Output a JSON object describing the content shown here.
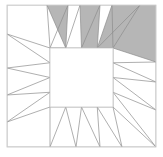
{
  "figure": {
    "type": "geometric-diagram",
    "canvas": {
      "width": 163,
      "height": 157
    },
    "colors": {
      "background": "#ffffff",
      "shaded_fill": "#b6b6b6",
      "unshaded_fill": "#ffffff",
      "stroke": "#8c8c8c",
      "frame_stroke": "#cccccc",
      "inner_square_stroke": "#cfcfcf"
    },
    "stroke_width": 0.7,
    "frame": {
      "x": 7,
      "y": 5,
      "width": 149,
      "height": 142
    },
    "inner_square": {
      "x": 50,
      "y": 48,
      "width": 63,
      "height": 59
    },
    "counts": {
      "total_points": 16,
      "shaded_points": 4,
      "unshaded_points": 12,
      "edges_per_side": 4
    },
    "rays": [
      {
        "id": "top-1",
        "side": "top",
        "shaded": false,
        "apex": [
          47,
          5
        ],
        "base": [
          50,
          48
        ],
        "base2": [
          65.75,
          48
        ]
      },
      {
        "id": "top-2",
        "side": "top",
        "shaded": true,
        "apex": [
          68,
          5
        ],
        "base": [
          65.75,
          48
        ],
        "base2": [
          50,
          48
        ]
      },
      {
        "id": "top-3",
        "side": "top",
        "shaded": false,
        "apex": [
          80,
          5
        ],
        "base": [
          81.5,
          48
        ],
        "base2": [
          65.75,
          48
        ]
      },
      {
        "id": "top-4",
        "side": "top",
        "shaded": true,
        "apex": [
          100,
          5
        ],
        "base": [
          81.5,
          48
        ],
        "base2": [
          97.25,
          48
        ]
      },
      {
        "id": "top-5",
        "side": "top",
        "shaded": false,
        "apex": [
          112,
          5
        ],
        "base": [
          97.25,
          48
        ],
        "base2": [
          113,
          48
        ]
      },
      {
        "id": "top-6",
        "side": "top",
        "shaded": true,
        "apex": [
          140,
          5
        ],
        "base": [
          113,
          48
        ],
        "base2": [
          97.25,
          48
        ]
      },
      {
        "id": "right-1",
        "side": "right",
        "shaded": true,
        "apex": [
          156,
          62
        ],
        "base": [
          113,
          48
        ],
        "base2": [
          113,
          62.75
        ]
      },
      {
        "id": "right-2",
        "side": "right",
        "shaded": false,
        "apex": [
          156,
          82
        ],
        "base": [
          113,
          62.75
        ],
        "base2": [
          113,
          77.5
        ]
      },
      {
        "id": "right-3",
        "side": "right",
        "shaded": false,
        "apex": [
          156,
          110
        ],
        "base": [
          113,
          77.5
        ],
        "base2": [
          113,
          92.25
        ]
      },
      {
        "id": "right-4",
        "side": "right",
        "shaded": false,
        "apex": [
          156,
          147
        ],
        "base": [
          113,
          92.25
        ],
        "base2": [
          113,
          107
        ]
      },
      {
        "id": "bottom-1",
        "side": "bottom",
        "shaded": false,
        "apex": [
          122,
          147
        ],
        "base": [
          113,
          107
        ],
        "base2": [
          97.25,
          107
        ]
      },
      {
        "id": "bottom-2",
        "side": "bottom",
        "shaded": false,
        "apex": [
          100,
          147
        ],
        "base": [
          97.25,
          107
        ],
        "base2": [
          81.5,
          107
        ]
      },
      {
        "id": "bottom-3",
        "side": "bottom",
        "shaded": false,
        "apex": [
          76,
          147
        ],
        "base": [
          81.5,
          107
        ],
        "base2": [
          65.75,
          107
        ]
      },
      {
        "id": "bottom-4",
        "side": "bottom",
        "shaded": false,
        "apex": [
          50,
          147
        ],
        "base": [
          65.75,
          107
        ],
        "base2": [
          50,
          107
        ]
      },
      {
        "id": "left-1",
        "side": "left",
        "shaded": false,
        "apex": [
          7,
          122
        ],
        "base": [
          50,
          107
        ],
        "base2": [
          50,
          92.25
        ]
      },
      {
        "id": "left-2",
        "side": "left",
        "shaded": false,
        "apex": [
          7,
          95
        ],
        "base": [
          50,
          92.25
        ],
        "base2": [
          50,
          77.5
        ]
      },
      {
        "id": "left-3",
        "side": "left",
        "shaded": false,
        "apex": [
          7,
          68
        ],
        "base": [
          50,
          77.5
        ],
        "base2": [
          50,
          62.75
        ]
      },
      {
        "id": "left-4",
        "side": "left",
        "shaded": false,
        "apex": [
          7,
          34
        ],
        "base": [
          50,
          62.75
        ],
        "base2": [
          50,
          48
        ]
      }
    ],
    "shaded_polygons": [
      {
        "id": "shade-top-left",
        "points": "47,5 68,5 65.75,48"
      },
      {
        "id": "shade-top-mid",
        "points": "80,5 100,5 97.25,48 81.5,48"
      },
      {
        "id": "shade-top-right",
        "points": "112,5 156,5 156,62 113,48 97.25,48"
      }
    ]
  }
}
